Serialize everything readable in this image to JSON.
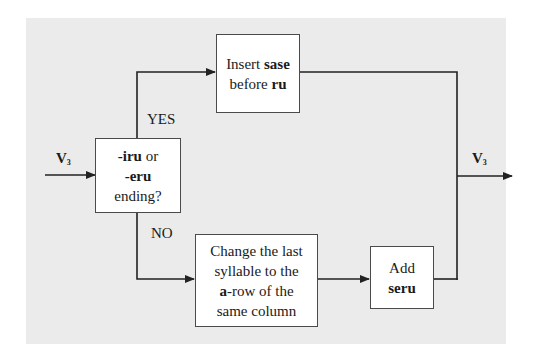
{
  "diagram": {
    "input_label": {
      "main": "V",
      "sub": "3"
    },
    "output_label": {
      "main": "V",
      "sub": "3"
    },
    "decision": {
      "line1_bold": "-iru",
      "line1_rest": " or",
      "line2_bold": "-eru",
      "line3": "ending?"
    },
    "yes_label": "YES",
    "no_label": "NO",
    "insert_box": {
      "line1_plain": "Insert ",
      "line1_bold": "sase",
      "line2_plain": "before ",
      "line2_bold": "ru"
    },
    "change_box": {
      "line1": "Change the last",
      "line2": "syllable to the",
      "line3_bold": "a",
      "line3_rest": "-row of the",
      "line4": "same column"
    },
    "add_box": {
      "line1": "Add",
      "line2_bold": "seru"
    },
    "colors": {
      "panel": "#ebebeb",
      "box": "#ffffff",
      "line": "#222222"
    }
  }
}
